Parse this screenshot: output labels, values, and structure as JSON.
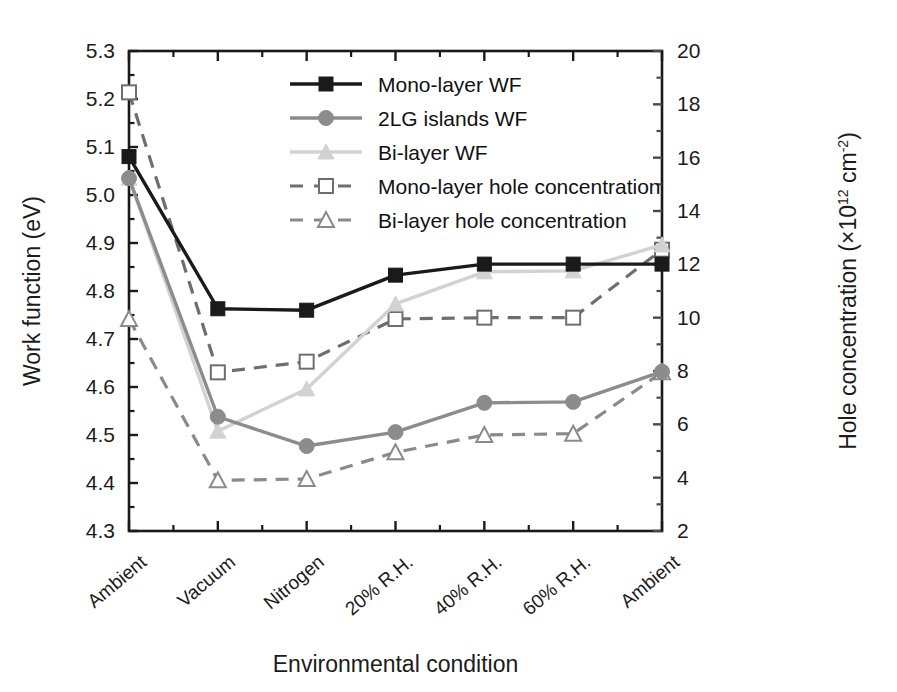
{
  "chart_data": {
    "type": "line",
    "title": "",
    "xlabel": "Environmental condition",
    "ylabel": "Work function (eV)",
    "y2label": "Hole concentration (×10¹² cm⁻²)",
    "ylabel_main": "Work function (eV)",
    "y2label_main": "Hole concentration (×10",
    "y2label_exp1": "12",
    "y2label_mid": " cm",
    "y2label_exp2": "-2",
    "y2label_end": ")",
    "categories": [
      "Ambient",
      "Vacuum",
      "Nitrogen",
      "20% R.H.",
      "40% R.H.",
      "60% R.H.",
      "Ambient"
    ],
    "ylim": [
      4.3,
      5.3
    ],
    "y2lim": [
      2,
      20
    ],
    "yticks": [
      "4.3",
      "4.4",
      "4.5",
      "4.6",
      "4.7",
      "4.8",
      "4.9",
      "5.0",
      "5.1",
      "5.2",
      "5.3"
    ],
    "y2ticks": [
      "2",
      "4",
      "6",
      "8",
      "10",
      "12",
      "14",
      "16",
      "18",
      "20"
    ],
    "grid": false,
    "legend_position": "top-center-right",
    "series": [
      {
        "name": "Mono-layer WF",
        "axis": "left",
        "marker": "filled-square",
        "line": "solid",
        "color": "#1a1a1a",
        "values": [
          5.08,
          4.763,
          4.76,
          4.833,
          4.856,
          4.856,
          4.856
        ]
      },
      {
        "name": "2LG islands WF",
        "axis": "left",
        "marker": "filled-circle",
        "line": "solid",
        "color": "#8c8c8c",
        "values": [
          5.035,
          4.538,
          4.477,
          4.506,
          4.567,
          4.569,
          4.632
        ]
      },
      {
        "name": "Bi-layer WF",
        "axis": "left",
        "marker": "filled-triangle",
        "line": "solid",
        "color": "#d2d2d2",
        "values": [
          5.035,
          4.508,
          4.596,
          4.773,
          4.84,
          4.842,
          4.896
        ]
      },
      {
        "name": "Mono-layer hole concentration",
        "axis": "right",
        "marker": "open-square",
        "line": "dashed",
        "color": "#6e6e6e",
        "values": [
          18.45,
          7.95,
          8.35,
          9.95,
          10.0,
          10.0,
          12.55
        ]
      },
      {
        "name": "Bi-layer hole concentration",
        "axis": "right",
        "marker": "open-triangle",
        "line": "dashed",
        "color": "#8a8a8a",
        "values": [
          9.95,
          3.9,
          3.95,
          4.95,
          5.6,
          5.65,
          7.95
        ]
      }
    ],
    "legend": [
      {
        "label": "Mono-layer WF",
        "marker": "filled-square",
        "line": "solid",
        "color": "#1a1a1a"
      },
      {
        "label": "2LG islands WF",
        "marker": "filled-circle",
        "line": "solid",
        "color": "#8c8c8c"
      },
      {
        "label": "Bi-layer WF",
        "marker": "filled-triangle",
        "line": "solid",
        "color": "#d2d2d2"
      },
      {
        "label": "Mono-layer hole concentration",
        "marker": "open-square",
        "line": "dashed",
        "color": "#6e6e6e"
      },
      {
        "label": "Bi-layer hole concentration",
        "marker": "open-triangle",
        "line": "dashed",
        "color": "#8a8a8a"
      }
    ]
  }
}
